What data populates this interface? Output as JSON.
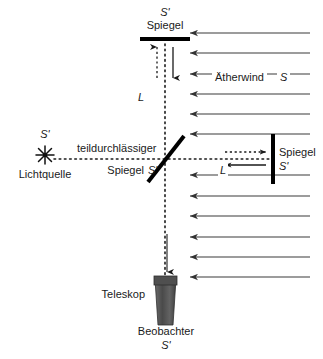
{
  "figure": {
    "type": "physics-diagram",
    "background_color": "#ffffff",
    "line_color": "#333333",
    "text_color": "#1a1a1a",
    "mirror_color": "#000000",
    "telescope_color": "#545454"
  },
  "labels": {
    "top_mirror_frame": "S'",
    "top_mirror": "Spiegel",
    "vertical_arm_length": "L",
    "ether_wind": "Ätherwind",
    "ether_wind_frame": "S",
    "source_frame": "S'",
    "source": "Lichtquelle",
    "beam_splitter_line1": "teildurchlässiger",
    "beam_splitter_line2": "Spiegel",
    "beam_splitter_frame": "S'",
    "horizontal_arm_length": "L",
    "right_mirror": "Spiegel",
    "right_mirror_frame": "S'",
    "telescope": "Teleskop",
    "observer": "Beobachter",
    "observer_frame": "S'"
  },
  "geometry": {
    "source_x": 45,
    "source_y": 155,
    "splitter_x": 165,
    "splitter_y": 159,
    "top_mirror_x": 165,
    "top_mirror_y": 38,
    "right_mirror_x": 273,
    "right_mirror_y": 159,
    "telescope_x": 165,
    "telescope_y": 280
  },
  "wind_arrows": {
    "count": 12,
    "x_start": 310,
    "x_end": 188,
    "direction": "right-to-left",
    "y_positions": [
      33,
      53,
      74,
      94,
      114,
      134,
      175,
      196,
      216,
      237,
      257,
      277
    ]
  },
  "beam_arrows": [
    {
      "name": "vertical-up-dashed",
      "style": "dashed",
      "direction": "up"
    },
    {
      "name": "vertical-down-solid",
      "style": "solid",
      "direction": "down"
    },
    {
      "name": "horizontal-right-dashed",
      "style": "dashed",
      "direction": "right"
    },
    {
      "name": "horizontal-left-solid",
      "style": "solid",
      "direction": "left"
    },
    {
      "name": "telescope-down-solid",
      "style": "solid",
      "direction": "down"
    }
  ]
}
